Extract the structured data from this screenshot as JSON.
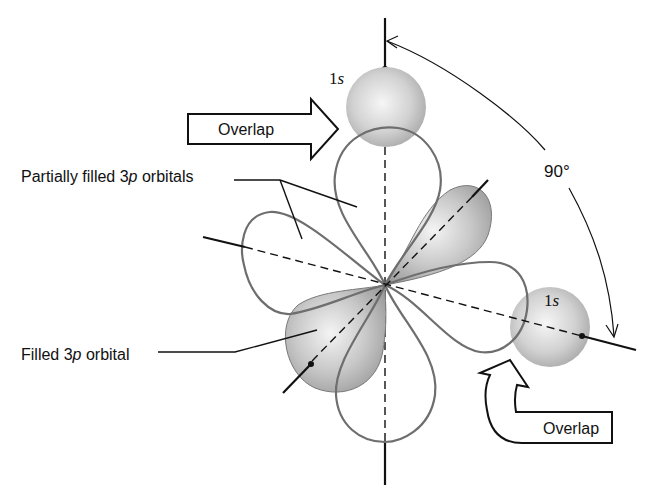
{
  "diagram": {
    "labels": {
      "s_top": {
        "num": "1",
        "letter": "s"
      },
      "s_right": {
        "num": "1",
        "letter": "s"
      },
      "overlap_top": "Overlap",
      "overlap_bottom": "Overlap",
      "angle": "90°",
      "partial": {
        "pre": "Partially filled 3",
        "p": "p",
        "post": " orbitals"
      },
      "filled": {
        "pre": "Filled 3",
        "p": "p",
        "post": " orbital"
      }
    },
    "colors": {
      "lobe_outline": "#6e6e6e",
      "axis": "#111111",
      "sphere_light": "#f2f2f2",
      "sphere_dark": "#a8a8a8"
    }
  }
}
